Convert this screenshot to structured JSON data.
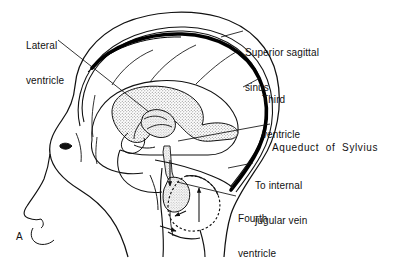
{
  "figure": {
    "panel_letter": "A",
    "background_color": "#ffffff",
    "ink_color": "#111111",
    "stipple_fill_color": "#d8d8d8"
  },
  "labels": [
    {
      "id": "lateral-ventricle",
      "lines": [
        "Lateral",
        "ventricle"
      ],
      "x": 26,
      "y": 17,
      "align": "left"
    },
    {
      "id": "superior-sagittal-sinus",
      "lines": [
        "Superior sagittal",
        "sinus"
      ],
      "x": 245,
      "y": 24,
      "align": "left"
    },
    {
      "id": "third-ventricle",
      "lines": [
        "Third",
        "ventricle"
      ],
      "x": 262,
      "y": 71,
      "align": "left"
    },
    {
      "id": "aqueduct-of-sylvius",
      "lines": [
        "Aqueduct  of  Sylvius"
      ],
      "x": 272,
      "y": 119,
      "align": "left",
      "spacing": "wide"
    },
    {
      "id": "to-internal-jugular-vein",
      "lines": [
        "To internal",
        "jugular vein"
      ],
      "x": 255,
      "y": 157,
      "align": "left"
    },
    {
      "id": "fourth-ventricle",
      "lines": [
        "Fourth",
        "ventricle"
      ],
      "x": 238,
      "y": 190,
      "align": "left"
    }
  ],
  "structures": [
    {
      "id": "scalp-outline",
      "kind": "line",
      "description": "outer scalp contour of head in profile"
    },
    {
      "id": "skull-inner-table",
      "kind": "line",
      "description": "inner skull table contour"
    },
    {
      "id": "superior-sagittal-sinus-band",
      "kind": "filled-band",
      "description": "thick black dural venous sinus band along vertex and posterior skull"
    },
    {
      "id": "facial-profile",
      "kind": "line",
      "description": "forehead, nose, lips and chin profile"
    },
    {
      "id": "eye",
      "kind": "line",
      "description": "eye marking on face"
    },
    {
      "id": "cerebrum",
      "kind": "line",
      "description": "cerebral hemisphere outline with sulci"
    },
    {
      "id": "lateral-ventricle-body",
      "kind": "stippled",
      "description": "C-shaped stippled lateral ventricle"
    },
    {
      "id": "third-ventricle-chamber",
      "kind": "stippled",
      "description": "stippled third ventricle chamber"
    },
    {
      "id": "cerebral-aqueduct",
      "kind": "channel",
      "description": "narrow aqueduct of Sylvius descending to fourth ventricle"
    },
    {
      "id": "fourth-ventricle-chamber",
      "kind": "stippled",
      "description": "fourth ventricle beneath cerebellum"
    },
    {
      "id": "cerebellum",
      "kind": "dotted-outline",
      "description": "cerebellum with stippled dashed border"
    },
    {
      "id": "brainstem",
      "kind": "line",
      "description": "brainstem and spinal cord continuation"
    },
    {
      "id": "csf-flow-arrows",
      "kind": "arrows",
      "description": "arrows indicating cerebrospinal fluid circulation direction"
    }
  ],
  "leader_lines": [
    {
      "for": "lateral-ventricle",
      "from": [
        60,
        42
      ],
      "to": [
        149,
        112
      ]
    },
    {
      "for": "superior-sagittal-sinus",
      "from": [
        243,
        31
      ],
      "to": [
        222,
        37
      ]
    },
    {
      "for": "third-ventricle",
      "from": [
        260,
        78
      ],
      "to": [
        243,
        86
      ]
    },
    {
      "for": "aqueduct-of-sylvius",
      "from": [
        270,
        124
      ],
      "to": [
        178,
        141
      ]
    },
    {
      "for": "to-internal-jugular-vein",
      "from": [
        253,
        163
      ],
      "to": [
        228,
        168
      ]
    },
    {
      "for": "fourth-ventricle",
      "from": [
        236,
        196
      ],
      "to": [
        176,
        182
      ]
    }
  ]
}
